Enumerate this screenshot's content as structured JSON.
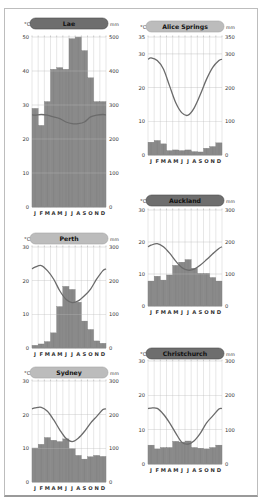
{
  "colors": {
    "bar": "#8a8a8a",
    "bar_stroke": "#777777",
    "line": "#6b6b6b",
    "grid": "#d7d7d7",
    "gridline_major": "#b8b8b8",
    "pill_dark": "#6e6e6e",
    "pill_light": "#bcbcbc",
    "axis_text": "#333333"
  },
  "months": [
    "J",
    "F",
    "M",
    "A",
    "M",
    "J",
    "J",
    "A",
    "S",
    "O",
    "N",
    "D"
  ],
  "chart_data": [
    {
      "type": "bar+line",
      "title": "Lae",
      "pill_style": "dark",
      "ylabel_left": "°C",
      "ylabel_right": "mm",
      "temp_ticks": [
        0,
        10,
        20,
        30,
        40,
        50
      ],
      "precip_ticks": [
        0,
        100,
        200,
        300,
        400,
        500
      ],
      "temp_range": [
        0,
        50
      ],
      "precip_range": [
        0,
        500
      ],
      "categories": [
        "J",
        "F",
        "M",
        "A",
        "M",
        "J",
        "J",
        "A",
        "S",
        "O",
        "N",
        "D"
      ],
      "series": [
        {
          "name": "Precipitation (mm)",
          "type": "bar",
          "values": [
            290,
            240,
            310,
            405,
            410,
            405,
            495,
            500,
            460,
            380,
            310,
            310
          ]
        },
        {
          "name": "Temperature (°C)",
          "type": "line",
          "values": [
            27,
            27.2,
            27,
            26.5,
            26,
            25,
            24.5,
            24.5,
            25,
            26.5,
            27,
            27.2
          ]
        }
      ]
    },
    {
      "type": "bar+line",
      "title": "Alice Springs",
      "pill_style": "light",
      "ylabel_left": "°C",
      "ylabel_right": "mm",
      "temp_ticks": [
        0,
        10,
        20,
        30,
        35
      ],
      "precip_ticks": [
        0,
        100,
        200,
        300,
        350
      ],
      "temp_range": [
        0,
        35
      ],
      "precip_range": [
        0,
        350
      ],
      "categories": [
        "J",
        "F",
        "M",
        "A",
        "M",
        "J",
        "J",
        "A",
        "S",
        "O",
        "N",
        "D"
      ],
      "series": [
        {
          "name": "Precipitation (mm)",
          "type": "bar",
          "values": [
            38,
            43,
            33,
            13,
            15,
            13,
            15,
            10,
            9,
            20,
            25,
            36
          ]
        },
        {
          "name": "Temperature (°C)",
          "type": "line",
          "values": [
            28.8,
            28,
            25.5,
            20.5,
            15.5,
            12.5,
            11.8,
            14,
            18,
            22.5,
            26,
            28
          ]
        }
      ]
    },
    {
      "type": "bar+line",
      "title": "Auckland",
      "pill_style": "dark",
      "ylabel_left": "°C",
      "ylabel_right": "mm",
      "temp_ticks": [
        0,
        10,
        20,
        30
      ],
      "precip_ticks": [
        0,
        100,
        200,
        300
      ],
      "temp_range": [
        0,
        30
      ],
      "precip_range": [
        0,
        300
      ],
      "categories": [
        "J",
        "F",
        "M",
        "A",
        "M",
        "J",
        "J",
        "A",
        "S",
        "O",
        "N",
        "D"
      ],
      "series": [
        {
          "name": "Precipitation (mm)",
          "type": "bar",
          "values": [
            78,
            93,
            81,
            97,
            127,
            137,
            145,
            118,
            102,
            102,
            89,
            78
          ]
        },
        {
          "name": "Temperature (°C)",
          "type": "line",
          "values": [
            19,
            19.5,
            18.5,
            16.5,
            14,
            12,
            11.2,
            11.5,
            12.8,
            14.5,
            16.3,
            18
          ]
        }
      ]
    },
    {
      "type": "bar+line",
      "title": "Perth",
      "pill_style": "light",
      "ylabel_left": "°C",
      "ylabel_right": "mm",
      "temp_ticks": [
        0,
        10,
        20,
        30
      ],
      "precip_ticks": [
        0,
        100,
        200,
        300
      ],
      "temp_range": [
        0,
        30
      ],
      "precip_range": [
        0,
        300
      ],
      "categories": [
        "J",
        "F",
        "M",
        "A",
        "M",
        "J",
        "J",
        "A",
        "S",
        "O",
        "N",
        "D"
      ],
      "series": [
        {
          "name": "Precipitation (mm)",
          "type": "bar",
          "values": [
            8,
            12,
            19,
            45,
            123,
            183,
            174,
            136,
            80,
            55,
            21,
            14
          ]
        },
        {
          "name": "Temperature (°C)",
          "type": "line",
          "values": [
            24,
            24.5,
            23,
            20.5,
            17,
            14.5,
            13.5,
            14,
            15.5,
            17.5,
            20.5,
            23
          ]
        }
      ]
    },
    {
      "type": "bar+line",
      "title": "Christchurch",
      "pill_style": "dark",
      "ylabel_left": "°C",
      "ylabel_right": "mm",
      "temp_ticks": [
        0,
        10,
        20,
        30
      ],
      "precip_ticks": [
        0,
        100,
        200,
        300
      ],
      "temp_range": [
        0,
        30
      ],
      "precip_range": [
        0,
        300
      ],
      "categories": [
        "J",
        "F",
        "M",
        "A",
        "M",
        "J",
        "J",
        "A",
        "S",
        "O",
        "N",
        "D"
      ],
      "series": [
        {
          "name": "Precipitation (mm)",
          "type": "bar",
          "values": [
            55,
            44,
            48,
            48,
            66,
            64,
            67,
            48,
            46,
            44,
            48,
            55
          ]
        },
        {
          "name": "Temperature (°C)",
          "type": "line",
          "values": [
            16.3,
            16.2,
            14.5,
            12,
            9,
            6.3,
            5.8,
            6.8,
            9,
            12,
            14,
            16
          ]
        }
      ]
    },
    {
      "type": "bar+line",
      "title": "Sydney",
      "pill_style": "light",
      "ylabel_left": "°C",
      "ylabel_right": "mm",
      "temp_ticks": [
        0,
        10,
        20,
        30
      ],
      "precip_ticks": [
        0,
        100,
        200,
        300
      ],
      "temp_range": [
        0,
        30
      ],
      "precip_range": [
        0,
        300
      ],
      "categories": [
        "J",
        "F",
        "M",
        "A",
        "M",
        "J",
        "J",
        "A",
        "S",
        "O",
        "N",
        "D"
      ],
      "series": [
        {
          "name": "Precipitation (mm)",
          "type": "bar",
          "values": [
            101,
            112,
            132,
            124,
            120,
            128,
            99,
            79,
            68,
            75,
            79,
            76
          ]
        },
        {
          "name": "Temperature (°C)",
          "type": "line",
          "values": [
            22,
            22.2,
            21,
            18.5,
            15.5,
            13,
            12,
            13,
            15,
            17.5,
            19.5,
            21.5
          ]
        }
      ]
    }
  ],
  "layout": [
    {
      "left": 18,
      "top": 16,
      "pill_top": 2,
      "plot_top": 21,
      "plot_h": 170,
      "x0": 14,
      "w": 74
    },
    {
      "left": 134,
      "top": 18,
      "pill_top": 3,
      "plot_top": 19,
      "plot_h": 118,
      "x0": 14,
      "w": 74
    },
    {
      "left": 134,
      "top": 192,
      "pill_top": 3,
      "plot_top": 18,
      "plot_h": 96,
      "x0": 14,
      "w": 74
    },
    {
      "left": 18,
      "top": 230,
      "pill_top": 3,
      "plot_top": 17,
      "plot_h": 101,
      "x0": 14,
      "w": 74
    },
    {
      "left": 134,
      "top": 345,
      "pill_top": 3,
      "plot_top": 16,
      "plot_h": 103,
      "x0": 14,
      "w": 74
    },
    {
      "left": 18,
      "top": 364,
      "pill_top": 3,
      "plot_top": 17,
      "plot_h": 101,
      "x0": 14,
      "w": 74
    }
  ]
}
